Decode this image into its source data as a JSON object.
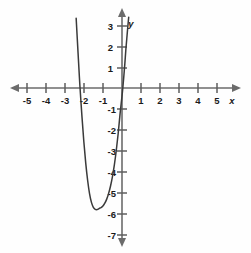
{
  "figure": {
    "title": "",
    "background_color": "#fefefe",
    "axis_color": "#6b6b6b",
    "curve_color": "#3a3a3a",
    "label_color": "#1a1a1a"
  },
  "axes": {
    "x_name": "x",
    "y_name": "y",
    "x_tick_labels": [
      "-5",
      "-4",
      "-3",
      "-2",
      "-1",
      "1",
      "2",
      "3",
      "4",
      "5"
    ],
    "y_tick_labels": [
      "3",
      "2",
      "1",
      "-1",
      "-2",
      "-3",
      "-4",
      "-5",
      "-6",
      "-7"
    ]
  },
  "chart_data": {
    "type": "line",
    "title": "",
    "xlabel": "x",
    "ylabel": "y",
    "xlim": [
      -5,
      5
    ],
    "ylim": [
      -7,
      3
    ],
    "grid": false,
    "legend": null,
    "x_ticks": [
      -5,
      -4,
      -3,
      -2,
      -1,
      1,
      2,
      3,
      4,
      5
    ],
    "y_ticks": [
      3,
      2,
      1,
      -1,
      -2,
      -3,
      -4,
      -5,
      -6,
      -7
    ],
    "annotations": {
      "vertex": [
        -1.15,
        -5.85
      ],
      "x_intercepts": [
        -2.27,
        0.05
      ],
      "y_intercept": -0.4
    },
    "series": [
      {
        "name": "curve",
        "x": [
          -2.4,
          -2.35,
          -2.3,
          -2.25,
          -2.2,
          -2.1,
          -2.0,
          -1.9,
          -1.8,
          -1.7,
          -1.6,
          -1.5,
          -1.4,
          -1.3,
          -1.2,
          -1.15,
          -1.1,
          -1.0,
          -0.9,
          -0.8,
          -0.7,
          -0.6,
          -0.5,
          -0.4,
          -0.3,
          -0.2,
          -0.1,
          0.0,
          0.05,
          0.1,
          0.15,
          0.2,
          0.25,
          0.3,
          0.35
        ],
        "y": [
          3.4,
          2.55,
          1.7,
          0.85,
          0.05,
          -1.35,
          -2.6,
          -3.65,
          -4.5,
          -5.15,
          -5.58,
          -5.82,
          -5.92,
          -5.93,
          -5.88,
          -5.85,
          -5.84,
          -5.76,
          -5.62,
          -5.42,
          -5.14,
          -4.78,
          -4.32,
          -3.75,
          -3.05,
          -2.22,
          -1.25,
          -0.4,
          0.08,
          0.62,
          1.2,
          1.85,
          2.4,
          2.95,
          3.45
        ]
      }
    ]
  }
}
